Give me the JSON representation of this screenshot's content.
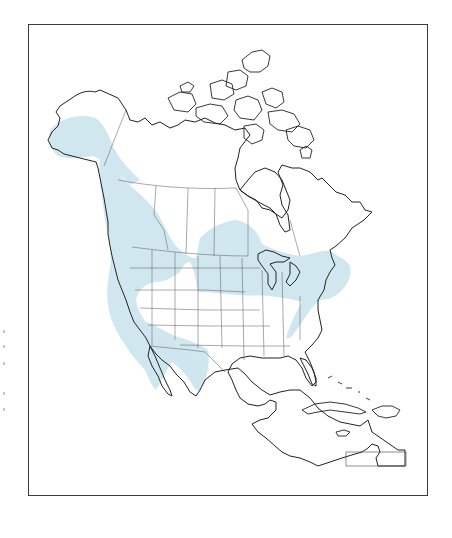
{
  "map": {
    "type": "species-range-map",
    "region": "North America",
    "range_color": "#cfe6ef",
    "outline_color": "#222222",
    "frame_color": "#3a3a3a",
    "background_color": "#ffffff",
    "range_areas": [
      "Alaska (south-central and southeast)",
      "Pacific coast (British Columbia to Baja California)",
      "Northern Rocky Mountains",
      "Northern Great Plains / Prairie Provinces",
      "Great Lakes region",
      "Northeastern United States and southern Quebec",
      "Appalachian Mountains",
      "Southwestern United States to northwestern Mexico"
    ]
  }
}
